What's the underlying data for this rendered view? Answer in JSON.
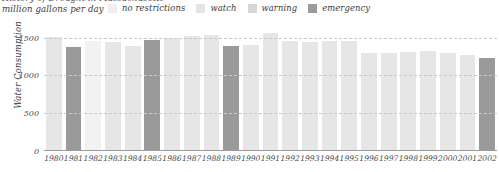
{
  "header": {
    "clipped_title": "History of Drought in Massachusetts",
    "units_label": "million gallons per day"
  },
  "legend": {
    "position": "top",
    "items": [
      {
        "label": "no restrictions",
        "color": "#efefef"
      },
      {
        "label": "watch",
        "color": "#e4e4e4"
      },
      {
        "label": "warning",
        "color": "#d6d6d6"
      },
      {
        "label": "emergency",
        "color": "#9a9a9a"
      }
    ]
  },
  "chart_data": {
    "type": "bar",
    "title": "History of Drought in Massachusetts",
    "subtitle": "million gallons per day",
    "xlabel": "",
    "ylabel": "Water Consumption",
    "ylim": [
      0,
      1600
    ],
    "yticks": [
      0,
      500,
      1000,
      1500
    ],
    "ytick_labels": [
      "0",
      "500",
      "1000",
      "1500"
    ],
    "grid": true,
    "legend_position": "top",
    "categories": [
      "1980",
      "1981",
      "1982",
      "1983",
      "1984",
      "1985",
      "1986",
      "1987",
      "1988",
      "1989",
      "1990",
      "1991",
      "1992",
      "1993",
      "1994",
      "1995",
      "1996",
      "1997",
      "1998",
      "1999",
      "2000",
      "2001",
      "2002"
    ],
    "values": [
      1505,
      1375,
      1455,
      1435,
      1385,
      1470,
      1500,
      1520,
      1530,
      1390,
      1405,
      1560,
      1450,
      1440,
      1450,
      1455,
      1290,
      1295,
      1310,
      1320,
      1290,
      1275,
      1230
    ],
    "status": [
      "no restrictions",
      "emergency",
      "watch",
      "no restrictions",
      "no restrictions",
      "emergency",
      "no restrictions",
      "no restrictions",
      "no restrictions",
      "emergency",
      "no restrictions",
      "no restrictions",
      "no restrictions",
      "no restrictions",
      "no restrictions",
      "no restrictions",
      "no restrictions",
      "no restrictions",
      "no restrictions",
      "no restrictions",
      "no restrictions",
      "no restrictions",
      "emergency"
    ],
    "status_colors": {
      "no restrictions": "#e6e6e6",
      "watch": "#f2f2f2",
      "warning": "#d6d6d6",
      "emergency": "#9a9a9a"
    }
  }
}
